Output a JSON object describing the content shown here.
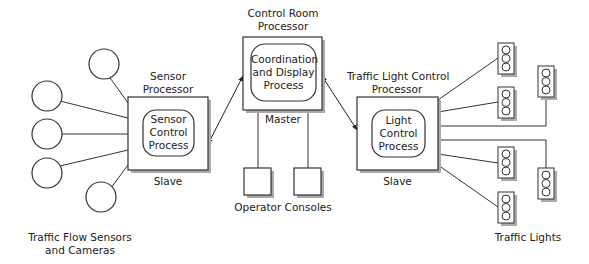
{
  "control_room": {
    "title_line1": "Control Room",
    "title_line2": "Processor",
    "process_line1": "Coordination",
    "process_line2": "and Display",
    "process_line3": "Process",
    "role": "Master"
  },
  "sensor": {
    "title_line1": "Sensor",
    "title_line2": "Processor",
    "process_line1": "Sensor",
    "process_line2": "Control",
    "process_line3": "Process",
    "role": "Slave"
  },
  "light": {
    "title_line1": "Traffic Light Control",
    "title_line2": "Processor",
    "process_line1": "Light",
    "process_line2": "Control",
    "process_line3": "Process",
    "role": "Slave"
  },
  "operator_consoles": {
    "label": "Operator Consoles"
  },
  "sensors_group": {
    "label_line1": "Traffic Flow Sensors",
    "label_line2": "and Cameras"
  },
  "lights_group": {
    "label": "Traffic Lights"
  }
}
